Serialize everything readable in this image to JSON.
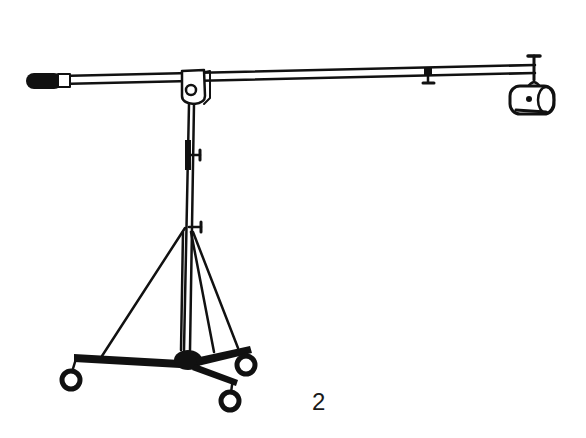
{
  "figure": {
    "label": "2",
    "colors": {
      "ink": "#111111",
      "background": "#ffffff"
    }
  }
}
